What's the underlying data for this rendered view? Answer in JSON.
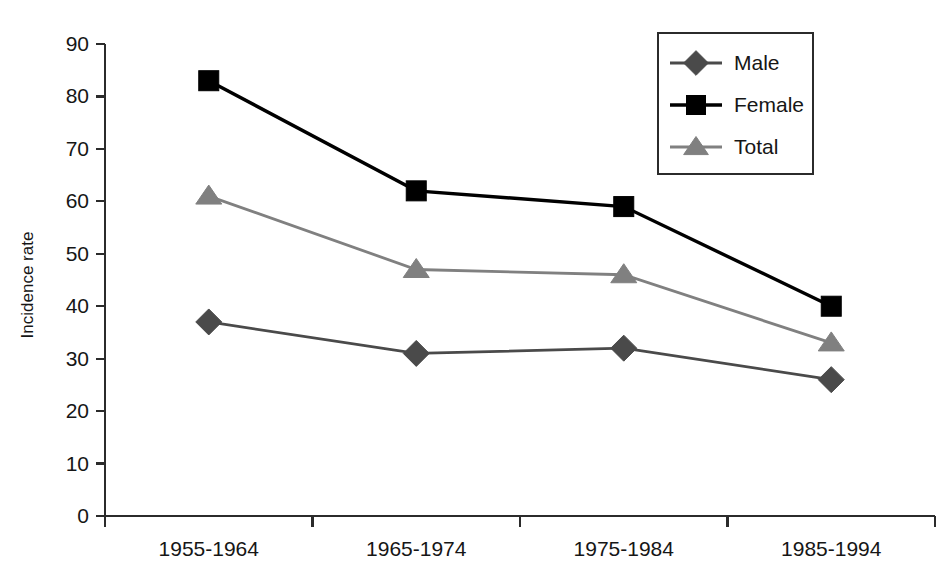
{
  "chart_data": {
    "type": "line",
    "title": "",
    "subtitle": "",
    "xlabel": "",
    "ylabel": "Incidence rate",
    "categories": [
      "1955-1964",
      "1965-1974",
      "1975-1984",
      "1985-1994"
    ],
    "series": [
      {
        "name": "Male",
        "values": [
          37,
          31,
          32,
          26
        ],
        "color": "#4a4a4a",
        "marker": "diamond"
      },
      {
        "name": "Female",
        "values": [
          83,
          62,
          59,
          40
        ],
        "color": "#000000",
        "marker": "square"
      },
      {
        "name": "Total",
        "values": [
          61,
          47,
          46,
          33
        ],
        "color": "#808080",
        "marker": "triangle"
      }
    ],
    "ylim": [
      0,
      90
    ],
    "yticks": [
      0,
      10,
      20,
      30,
      40,
      50,
      60,
      70,
      80,
      90
    ],
    "ytick_labels": [
      "0",
      "10",
      "20",
      "30",
      "40",
      "50",
      "60",
      "70",
      "80",
      "90"
    ],
    "grid": false,
    "legend_position": "top-right",
    "legend_entries": [
      "Male",
      "Female",
      "Total"
    ],
    "annotations": []
  },
  "axes": {
    "y_axis_title": "Incidence rate"
  }
}
